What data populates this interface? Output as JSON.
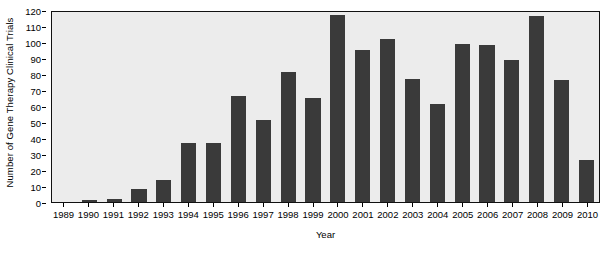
{
  "chart_data": {
    "type": "bar",
    "title": "",
    "xlabel": "Year",
    "ylabel": "Number of Gene Therapy Clinical Trials",
    "categories": [
      "1989",
      "1990",
      "1991",
      "1992",
      "1993",
      "1994",
      "1995",
      "1996",
      "1997",
      "1998",
      "1999",
      "2000",
      "2001",
      "2002",
      "2003",
      "2004",
      "2005",
      "2006",
      "2007",
      "2008",
      "2009",
      "2010"
    ],
    "values": [
      0,
      1,
      2,
      8,
      14,
      37,
      37,
      66,
      51,
      81,
      65,
      117,
      95,
      102,
      77,
      61,
      99,
      98,
      89,
      116,
      76,
      26
    ],
    "ylim": [
      0,
      120
    ],
    "yticks": [
      0,
      10,
      20,
      30,
      40,
      50,
      60,
      70,
      80,
      90,
      100,
      110,
      120
    ],
    "ytick_labels": [
      "0",
      "10",
      "20",
      "30",
      "40",
      "50",
      "60",
      "70",
      "80",
      "90",
      "100",
      "110",
      "120"
    ],
    "grid": false,
    "legend": null,
    "bar_color": "#3a3a3a",
    "plot_background": "#ececec",
    "figure_background": "#ffffff",
    "axis_color": "#111111"
  }
}
